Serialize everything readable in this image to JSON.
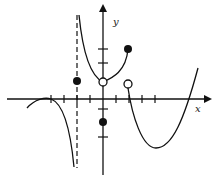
{
  "figure": {
    "type": "function-graph",
    "axis_labels": {
      "x": "x",
      "y": "y"
    },
    "colors": {
      "stroke": "#111111",
      "background": "#ffffff"
    },
    "origin_px": [
      103,
      99
    ],
    "unit_px": {
      "x": 12.7,
      "y": 12.5
    },
    "x_ticks": [
      -4,
      -3,
      -2,
      -1,
      1,
      2,
      3,
      4
    ],
    "y_ticks": [
      -3,
      -1,
      3,
      4
    ],
    "vertical_asymptote": {
      "x": -2,
      "style": "dashed"
    },
    "branches": [
      {
        "name": "left-branch",
        "description": "rises to touch x-axis at x=-4 then falls toward -infinity approaching x=-2"
      },
      {
        "name": "middle-branch",
        "description": "descends from +infinity near x=-2 to open point at (0, ~1.4), then rises to closed point at (2, ~4)"
      },
      {
        "name": "right-branch",
        "description": "starts at open point (2, ~1.2), dips to minimum near (4, ~-4), rises crossing x-axis near x=7"
      }
    ],
    "points": [
      {
        "name": "filled-point-at-neg2",
        "x": -2,
        "y": 1.4,
        "filled": true
      },
      {
        "name": "filled-point-at-0",
        "x": 0,
        "y": -2,
        "filled": true
      },
      {
        "name": "open-point-at-0",
        "x": 0,
        "y": 1.4,
        "filled": false
      },
      {
        "name": "filled-point-at-2",
        "x": 2,
        "y": 4,
        "filled": true
      },
      {
        "name": "open-point-at-2",
        "x": 2,
        "y": 1.2,
        "filled": false
      }
    ]
  }
}
